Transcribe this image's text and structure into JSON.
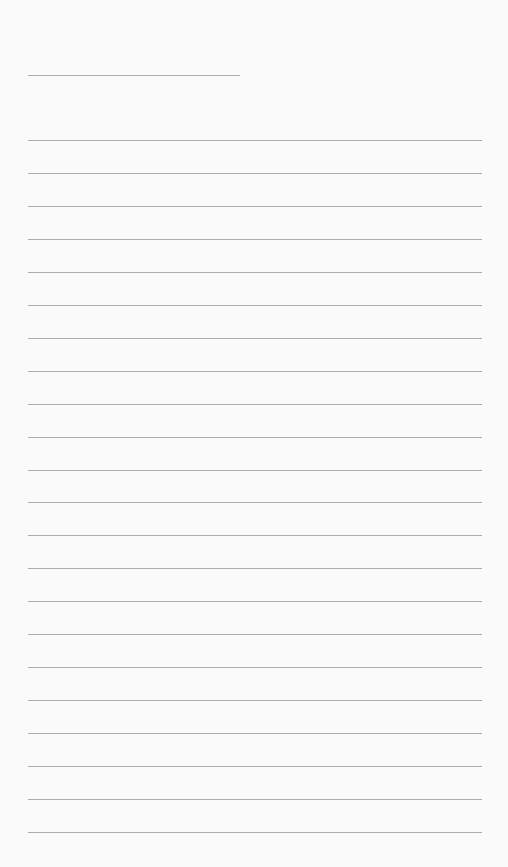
{
  "page": {
    "type": "lined-paper",
    "background_color": "#fafafa",
    "line_color": "#9c9c9c",
    "title_line": {
      "x": 28,
      "y": 75,
      "width": 212
    },
    "rules": {
      "count": 22,
      "x": 28,
      "width": 454,
      "first_y": 140,
      "spacing": 32.95
    }
  }
}
